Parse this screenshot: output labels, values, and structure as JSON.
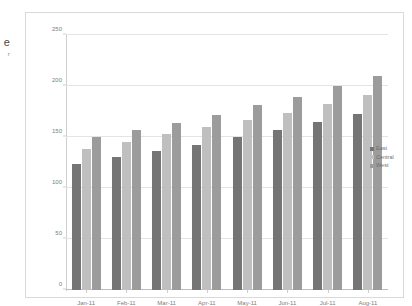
{
  "edge_label": {
    "text": "e",
    "sub": "r"
  },
  "legend": {
    "position": "right",
    "items": [
      {
        "label": "East",
        "color": "#757575"
      },
      {
        "label": "Central",
        "color": "#bfbfbf"
      },
      {
        "label": "West",
        "color": "#9c9c9c"
      }
    ]
  },
  "axis": {
    "y_ticks": [
      "0",
      "50",
      "100",
      "150",
      "200",
      "250"
    ],
    "x_ticks": [
      "Jan-11",
      "Feb-11",
      "Mar-11",
      "Apr-11",
      "May-11",
      "Jun-11",
      "Jul-11",
      "Aug-11"
    ]
  },
  "chart_data": {
    "type": "bar",
    "title": "",
    "xlabel": "",
    "ylabel": "",
    "ylim": [
      0,
      250
    ],
    "ytick_step": 50,
    "grid": true,
    "legend_position": "right",
    "orientation": "vertical",
    "grouping": "grouped",
    "categories": [
      "Jan-11",
      "Feb-11",
      "Mar-11",
      "Apr-11",
      "May-11",
      "Jun-11",
      "Jul-11",
      "Aug-11"
    ],
    "series": [
      {
        "name": "East",
        "color": "#757575",
        "values": [
          124,
          130,
          136,
          142,
          150,
          157,
          165,
          173
        ]
      },
      {
        "name": "Central",
        "color": "#bfbfbf",
        "values": [
          138,
          145,
          153,
          160,
          167,
          174,
          182,
          191
        ]
      },
      {
        "name": "West",
        "color": "#9c9c9c",
        "values": [
          150,
          157,
          164,
          172,
          181,
          189,
          200,
          210
        ]
      }
    ]
  }
}
